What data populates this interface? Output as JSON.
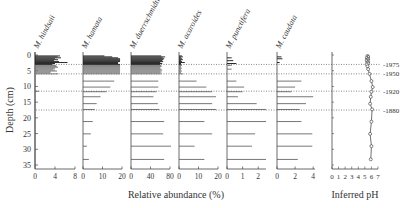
{
  "chart_data": {
    "type": "bar",
    "subtype": "stratigraphic-diagram",
    "ylabel": "Depth (cm)",
    "xlabel": "Relative abundance (%)",
    "ph_xlabel": "Inferred pH",
    "y_ticks": [
      0,
      5,
      10,
      15,
      20,
      25,
      30,
      35
    ],
    "ylim": [
      0,
      35
    ],
    "panels": [
      {
        "name": "M. hindsaii",
        "ticks": [
          0,
          4,
          8
        ],
        "xlim": [
          0,
          8
        ],
        "depths": [
          0.3,
          0.6,
          0.9,
          1.2,
          1.5,
          1.8,
          2.1,
          2.4,
          2.7,
          3.0,
          3.3,
          3.6,
          3.9,
          4.2,
          4.5,
          4.8,
          5.1,
          5.4,
          5.7,
          6.0,
          11.5
        ],
        "values": [
          5.0,
          4.5,
          5.2,
          4.0,
          4.6,
          3.8,
          4.8,
          6.5,
          4.0,
          3.5,
          4.2,
          4.4,
          4.6,
          4.0,
          3.6,
          4.0,
          4.4,
          3.2,
          3.0,
          4.6,
          0.8
        ]
      },
      {
        "name": "M. hamata",
        "ticks": [
          0,
          10,
          20
        ],
        "xlim": [
          0,
          20
        ],
        "depths": [
          0.3,
          0.6,
          0.9,
          1.2,
          1.5,
          1.8,
          2.1,
          2.4,
          2.7,
          3.0,
          3.3,
          3.6,
          3.9,
          4.2,
          4.5,
          4.8,
          5.1,
          5.4,
          5.7,
          6.0,
          8.3,
          10.2,
          11.7,
          13.3,
          15.5,
          17.3,
          21.2,
          25.1,
          29.0,
          33.2
        ],
        "values": [
          11,
          15,
          18,
          19,
          19,
          19,
          19,
          18,
          18,
          19,
          19,
          19,
          19,
          19,
          19,
          19,
          19,
          19,
          19,
          19,
          16,
          14,
          12,
          9,
          7,
          6,
          5,
          4,
          2,
          3
        ]
      },
      {
        "name": "M. duerrschmidtiae",
        "ticks": [
          0,
          40,
          80
        ],
        "xlim": [
          0,
          80
        ],
        "depths": [
          0.3,
          0.6,
          0.9,
          1.2,
          1.5,
          1.8,
          2.1,
          2.4,
          2.7,
          3.0,
          3.3,
          3.6,
          3.9,
          4.2,
          4.5,
          4.8,
          5.1,
          5.4,
          5.7,
          6.0,
          8.3,
          10.2,
          11.7,
          13.3,
          15.5,
          17.3,
          21.2,
          25.1,
          29.0,
          33.2
        ],
        "values": [
          62,
          70,
          65,
          68,
          66,
          64,
          66,
          60,
          64,
          60,
          62,
          63,
          60,
          60,
          62,
          64,
          60,
          63,
          60,
          62,
          56,
          56,
          52,
          46,
          55,
          58,
          68,
          66,
          82,
          68
        ]
      },
      {
        "name": "M. acaroides",
        "ticks": [
          0,
          10,
          20
        ],
        "xlim": [
          0,
          20
        ],
        "depths": [
          0.3,
          0.6,
          0.9,
          1.2,
          1.5,
          1.8,
          2.1,
          2.4,
          2.7,
          3.0,
          3.3,
          3.6,
          3.9,
          4.2,
          4.5,
          4.8,
          5.1,
          5.4,
          5.7,
          6.0,
          8.3,
          10.2,
          11.7,
          13.3,
          15.5,
          17.3,
          21.2,
          25.1,
          29.0,
          33.2
        ],
        "values": [
          1.5,
          2,
          1,
          1.5,
          2,
          1,
          1.5,
          3,
          1,
          1,
          1.5,
          1,
          1,
          1.5,
          1,
          1,
          1.5,
          1,
          1,
          2,
          9,
          14,
          17,
          19,
          17,
          19,
          13,
          17,
          8,
          13
        ]
      },
      {
        "name": "M. punctifera",
        "ticks": [
          0,
          1,
          2
        ],
        "xlim": [
          0,
          2.5
        ],
        "depths": [
          0.9,
          1.8,
          2.7,
          3.3,
          4.5,
          8.3,
          10.2,
          11.7,
          13.3,
          15.5,
          17.3,
          21.2,
          25.1,
          29.0,
          33.2
        ],
        "values": [
          0.3,
          0.4,
          0.6,
          0.3,
          0.3,
          0.6,
          1.1,
          1.0,
          0.7,
          1.9,
          2.5,
          2.5,
          1.8,
          1.6,
          2.5
        ]
      },
      {
        "name": "M. caudata",
        "ticks": [
          0,
          2,
          4
        ],
        "xlim": [
          0,
          4.2
        ],
        "depths": [
          0.6,
          1.2,
          2.4,
          8.3,
          10.2,
          11.7,
          13.3,
          15.5,
          17.3,
          21.2,
          25.1,
          29.0,
          33.2
        ],
        "values": [
          0.5,
          0.6,
          0.3,
          2.7,
          2.0,
          1.6,
          4.0,
          3.2,
          2.5,
          2.7,
          3.9,
          3.9,
          2.3
        ]
      }
    ],
    "ph": {
      "ticks": [
        0,
        1,
        2,
        3,
        4,
        5,
        6,
        7
      ],
      "xlim": [
        0,
        7
      ],
      "depths": [
        0.3,
        0.6,
        0.9,
        1.2,
        1.5,
        1.8,
        2.1,
        2.4,
        2.7,
        3.0,
        3.6,
        4.5,
        6.0,
        8.3,
        10.2,
        11.7,
        13.3,
        15.5,
        17.3,
        21.2,
        25.1,
        29.0,
        33.2
      ],
      "values": [
        5.4,
        5.5,
        5.3,
        5.5,
        5.4,
        5.3,
        5.5,
        5.4,
        5.5,
        5.3,
        5.4,
        5.5,
        5.7,
        6.0,
        6.2,
        6.0,
        5.9,
        5.8,
        6.1,
        6.0,
        5.8,
        6.0,
        5.9
      ]
    },
    "date_markers": [
      {
        "label": "-1975",
        "depth": 3.0
      },
      {
        "label": "-1950",
        "depth": 6.0
      },
      {
        "label": "-1920",
        "depth": 11.5
      },
      {
        "label": "-1880",
        "depth": 17.5
      }
    ]
  }
}
